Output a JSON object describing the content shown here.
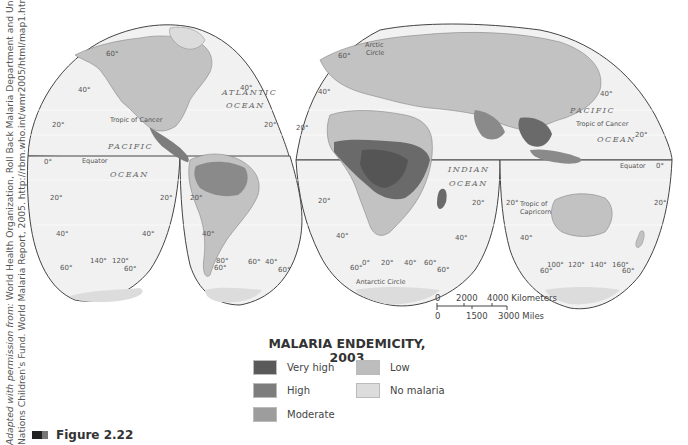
{
  "credit": {
    "line1_italic": "Adapted with permission from: ",
    "line1": "World Health Organization, Roll Back Malaria Department and United",
    "line2": "Nations Children's Fund. World Malaria Report, 2005. http://rbm.who.int/wmr2005/html/map1.htm"
  },
  "map": {
    "oceans": {
      "atlantic_1": "ATLANTIC",
      "atlantic_2": "OCEAN",
      "pacific_w1": "PACIFIC",
      "pacific_w2": "OCEAN",
      "indian_1": "INDIAN",
      "indian_2": "OCEAN",
      "pacific_e1": "PACIFIC",
      "pacific_e2": "OCEAN"
    },
    "lines": {
      "tropic_cancer_w": "Tropic of Cancer",
      "tropic_cancer_e": "Tropic of Cancer",
      "equator_w": "Equator",
      "equator_e": "Equator",
      "tropic_capricorn_1": "Tropic of",
      "tropic_capricorn_2": "Capricorn",
      "arctic_1": "Arctic",
      "arctic_2": "Circle",
      "antarctic": "Antarctic Circle"
    },
    "degrees": {
      "d60": "60°",
      "d40": "40°",
      "d20": "20°",
      "d0": "0°",
      "d140": "140°",
      "d120": "120°",
      "d80": "80°",
      "d100": "100°",
      "d160": "160°"
    }
  },
  "scale": {
    "km_labels": [
      "0",
      "2000",
      "4000 Kilometers"
    ],
    "mi_labels": [
      "0",
      "1500",
      "3000 Miles"
    ]
  },
  "legend": {
    "title_line1": "MALARIA ENDEMICITY,",
    "title_line2": "2003",
    "items": [
      {
        "label": "Very high",
        "color": "#5a5a5a"
      },
      {
        "label": "High",
        "color": "#7d7d7d"
      },
      {
        "label": "Moderate",
        "color": "#9d9d9d"
      },
      {
        "label": "Low",
        "color": "#bdbdbd"
      },
      {
        "label": "No malaria",
        "color": "#dcdcdc"
      }
    ]
  },
  "figure": {
    "label": "Figure 2.22"
  }
}
